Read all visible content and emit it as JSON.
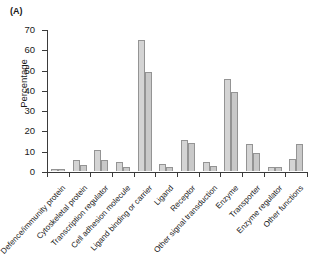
{
  "figure": {
    "panel_letter": "(A)",
    "ylabel": "Percentage"
  },
  "chart_data": {
    "type": "bar",
    "title": "",
    "xlabel": "",
    "ylabel": "Percentage",
    "ylim": [
      0,
      70
    ],
    "yticks": [
      0,
      10,
      20,
      30,
      40,
      50,
      60,
      70
    ],
    "grid": false,
    "legend": "none",
    "categories": [
      "Defence/immunity protein",
      "Cytoskeletal protein",
      "Transcription regulator",
      "Cell adhesion molecule",
      "Ligand binding or carrier",
      "Ligand",
      "Receptor",
      "Other signal transduction",
      "Enzyme",
      "Transporter",
      "Enzyme regulator",
      "Other functions"
    ],
    "series": [
      {
        "name": "Series 1",
        "values": [
          1.0,
          5.2,
          10.5,
          4.5,
          64.5,
          3.5,
          15.5,
          4.5,
          45.5,
          13.5,
          2.0,
          6.0
        ]
      },
      {
        "name": "Series 2",
        "values": [
          1.0,
          3.2,
          5.5,
          2.0,
          49.0,
          2.2,
          14.0,
          2.5,
          39.0,
          9.0,
          2.0,
          13.5
        ]
      }
    ],
    "colors": {
      "series_1_fill": "#d4d4d4",
      "series_2_fill": "#c9c9c9",
      "bar_outline": "#949494",
      "axis": "#3b3b3b"
    }
  }
}
